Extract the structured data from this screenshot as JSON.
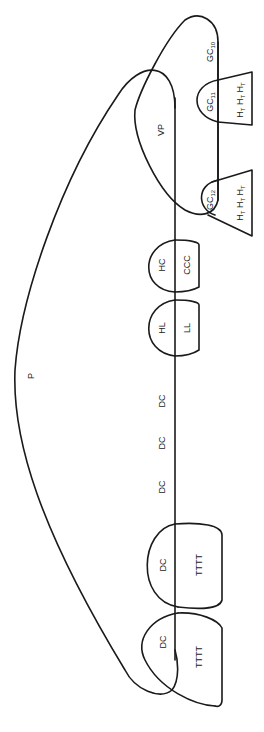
{
  "diagram": {
    "orientation": "rotated-90-ccw",
    "background": "#ffffff",
    "stroke_color": "#1a1a1a",
    "labels": {
      "p": "P",
      "vp": "VP",
      "gc10": {
        "base": "GC",
        "sub": "10"
      },
      "gc11": {
        "base": "GC",
        "sub": "11"
      },
      "gc12": {
        "base": "GC",
        "sub": "12"
      },
      "ht_group_1": {
        "base": "H",
        "sub": "T",
        "count": 3
      },
      "ht_group_2": {
        "base": "H",
        "sub": "T",
        "count": 3
      },
      "hc": "HC",
      "ccc": "CCC",
      "hl": "HL",
      "ll": "LL",
      "dc_1": "DC",
      "dc_2": "DC",
      "dc_3": "DC",
      "dc_4": "DC",
      "dc_5": "DC",
      "tttt_1": "TTTT",
      "tttt_2": "TTTT"
    }
  }
}
